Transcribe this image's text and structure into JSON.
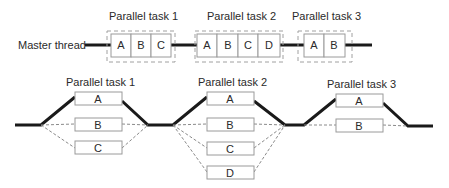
{
  "diagram": {
    "master_label": "Master thread",
    "top_tasks": [
      {
        "label": "Parallel task 1",
        "cells": [
          "A",
          "B",
          "C"
        ]
      },
      {
        "label": "Parallel task 2",
        "cells": [
          "A",
          "B",
          "C",
          "D"
        ]
      },
      {
        "label": "Parallel task 3",
        "cells": [
          "A",
          "B"
        ]
      }
    ],
    "bottom_tasks": [
      {
        "label": "Parallel task 1",
        "boxes": [
          "A",
          "B",
          "C"
        ]
      },
      {
        "label": "Parallel task 2",
        "boxes": [
          "A",
          "B",
          "C",
          "D"
        ]
      },
      {
        "label": "Parallel task 3",
        "boxes": [
          "A",
          "B"
        ]
      }
    ],
    "colors": {
      "line": "#1a1a1a",
      "box_border": "#9a9a9a",
      "dashed": "#a0a0a0",
      "text": "#2a2a2a"
    }
  }
}
